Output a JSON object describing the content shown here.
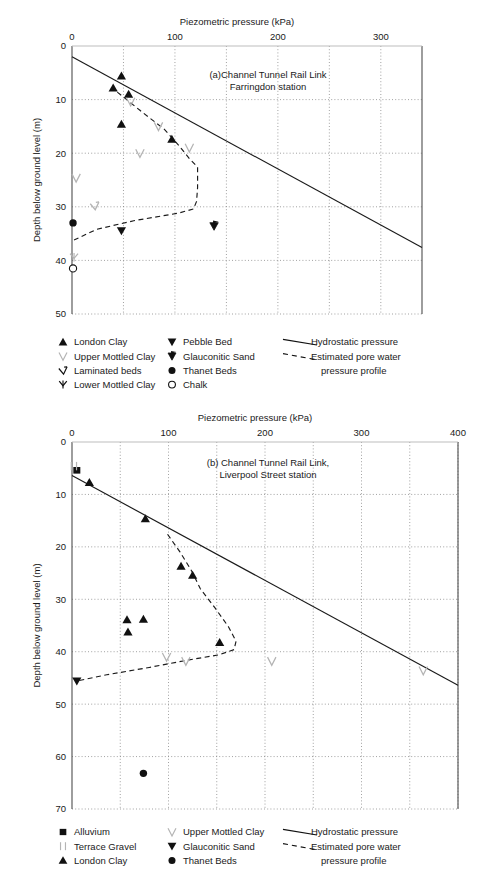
{
  "figure": {
    "panels": [
      "a",
      "b"
    ]
  },
  "chart_data": [
    {
      "id": "panel-a",
      "type": "scatter",
      "title": "(a)Channel Tunnel Rail Link",
      "title_line2": "Farringdon station",
      "xlabel": "Piezometric pressure (kPa)",
      "ylabel": "Depth below ground level (m)",
      "xlim": [
        0,
        340
      ],
      "ylim": [
        0,
        50
      ],
      "xticks": [
        0,
        100,
        200,
        300
      ],
      "xticklabels": [
        "0",
        "100",
        "200",
        "300"
      ],
      "xminor": [
        50,
        150,
        250
      ],
      "yticks": [
        0,
        10,
        20,
        30,
        40,
        50
      ],
      "yticklabels": [
        "0",
        "10",
        "20",
        "30",
        "40",
        "50"
      ],
      "grid": true,
      "legend_position": "below",
      "series": [
        {
          "name": "London Clay",
          "marker": "triangle-up",
          "color": "#111111",
          "points": [
            [
              48,
              5.6
            ],
            [
              40,
              7.8
            ],
            [
              55,
              9.0
            ],
            [
              48,
              14.6
            ],
            [
              97,
              17.4
            ]
          ]
        },
        {
          "name": "Upper Mottled Clay",
          "marker": "vee",
          "color": "#b4b4b4",
          "points": [
            [
              57,
              10.4
            ],
            [
              84,
              15.0
            ],
            [
              66,
              20.0
            ],
            [
              114,
              19.0
            ],
            [
              4,
              24.6
            ]
          ]
        },
        {
          "name": "Laminated beds",
          "marker": "vee-tilt",
          "color": "#b4b4b4",
          "points": [
            [
              22,
              29.8
            ]
          ]
        },
        {
          "name": "Lower Mottled Clay",
          "marker": "vee-stem",
          "color": "#b4b4b4",
          "points": [
            [
              2,
              39.4
            ]
          ]
        },
        {
          "name": "Pebble Bed",
          "marker": "triangle-down",
          "color": "#111111",
          "points": [
            [
              48,
              34.5
            ]
          ]
        },
        {
          "name": "Glauconitic Sand",
          "marker": "vee-flag",
          "color": "#111111",
          "points": [
            [
              138,
              33.6
            ]
          ]
        },
        {
          "name": "Thanet Beds",
          "marker": "circle",
          "color": "#111111",
          "points": [
            [
              1,
              33.0
            ]
          ]
        },
        {
          "name": "Chalk",
          "marker": "circle-open",
          "color": "#111111",
          "points": [
            [
              1,
              41.5
            ]
          ]
        }
      ],
      "lines": [
        {
          "name": "Hydrostatic pressure",
          "style": "solid",
          "points": [
            [
              0,
              2.0
            ],
            [
              340,
              37.6
            ]
          ]
        },
        {
          "name": "Estimated pore water pressure profile",
          "style": "dashed",
          "points": [
            [
              44,
              8.6
            ],
            [
              66,
              12.0
            ],
            [
              90,
              15.6
            ],
            [
              104,
              18.6
            ],
            [
              114,
              21.0
            ],
            [
              122,
              22.6
            ],
            [
              122,
              26.4
            ],
            [
              121,
              29.0
            ],
            [
              118,
              30.4
            ],
            [
              103,
              31.2
            ],
            [
              60,
              32.6
            ],
            [
              24,
              34.2
            ],
            [
              2,
              36.2
            ]
          ]
        }
      ],
      "legend": {
        "columns": [
          [
            {
              "label": "London Clay",
              "marker": "triangle-up",
              "color": "#111111"
            },
            {
              "label": "Upper Mottled Clay",
              "marker": "vee",
              "color": "#b4b4b4"
            },
            {
              "label": "Laminated beds",
              "marker": "vee-tilt",
              "color": "#111111"
            },
            {
              "label": "Lower Mottled Clay",
              "marker": "vee-stem",
              "color": "#111111"
            }
          ],
          [
            {
              "label": "Pebble Bed",
              "marker": "triangle-down",
              "color": "#111111"
            },
            {
              "label": "Glauconitic Sand",
              "marker": "vee-flag",
              "color": "#111111"
            },
            {
              "label": "Thanet Beds",
              "marker": "circle",
              "color": "#111111"
            },
            {
              "label": "Chalk",
              "marker": "circle-open",
              "color": "#111111"
            }
          ],
          [
            {
              "label": "Hydrostatic pressure",
              "marker": "line-solid",
              "color": "#111111"
            },
            {
              "label": "Estimated pore water",
              "marker": "line-dashed",
              "color": "#111111"
            },
            {
              "label": "pressure profile",
              "marker": "none",
              "color": "#111111"
            }
          ]
        ]
      }
    },
    {
      "id": "panel-b",
      "type": "scatter",
      "title": "(b) Channel Tunnel Rail Link,",
      "title_line2": "Liverpool Street station",
      "xlabel": "Piezometric pressure (kPa)",
      "ylabel": "Depth below ground level (m)",
      "xlim": [
        0,
        400
      ],
      "ylim": [
        0,
        70
      ],
      "xticks": [
        0,
        100,
        200,
        300,
        400
      ],
      "xticklabels": [
        "0",
        "100",
        "200",
        "300",
        "400"
      ],
      "xminor": [
        50,
        150,
        250,
        350
      ],
      "yticks": [
        0,
        10,
        20,
        30,
        40,
        50,
        60,
        70
      ],
      "yticklabels": [
        "0",
        "10",
        "20",
        "30",
        "40",
        "50",
        "60",
        "70"
      ],
      "grid": true,
      "legend_position": "below",
      "series": [
        {
          "name": "Alluvium",
          "marker": "square",
          "color": "#111111",
          "points": [
            [
              5,
              5.4
            ]
          ]
        },
        {
          "name": "Terrace Gravel",
          "marker": "bars",
          "color": "#b4b4b4",
          "points": [
            [
              2,
              4.6
            ]
          ]
        },
        {
          "name": "London Clay",
          "marker": "triangle-up",
          "color": "#111111",
          "points": [
            [
              18,
              7.7
            ],
            [
              76,
              14.6
            ],
            [
              113,
              23.7
            ],
            [
              125,
              25.4
            ],
            [
              57,
              33.9
            ],
            [
              74,
              33.8
            ],
            [
              58,
              36.2
            ],
            [
              153,
              38.2
            ]
          ]
        },
        {
          "name": "Upper Mottled Clay",
          "marker": "vee",
          "color": "#b4b4b4",
          "points": [
            [
              98,
              41.0
            ],
            [
              118,
              41.8
            ],
            [
              207,
              41.8
            ],
            [
              364,
              43.6
            ]
          ]
        },
        {
          "name": "Glauconitic Sand",
          "marker": "triangle-down",
          "color": "#111111",
          "points": [
            [
              5,
              45.6
            ]
          ]
        },
        {
          "name": "Thanet Beds",
          "marker": "circle",
          "color": "#111111",
          "points": [
            [
              74,
              63.2
            ]
          ]
        }
      ],
      "lines": [
        {
          "name": "Hydrostatic pressure",
          "style": "solid",
          "points": [
            [
              0,
              6.4
            ],
            [
              400,
              46.4
            ]
          ]
        },
        {
          "name": "Estimated pore water pressure profile",
          "style": "dashed",
          "points": [
            [
              99,
              17.6
            ],
            [
              112,
              21.0
            ],
            [
              124,
              24.6
            ],
            [
              133,
              28.0
            ],
            [
              148,
              31.6
            ],
            [
              162,
              35.2
            ],
            [
              170,
              38.0
            ],
            [
              168,
              39.6
            ],
            [
              152,
              40.6
            ],
            [
              120,
              41.6
            ],
            [
              80,
              43.0
            ],
            [
              36,
              44.4
            ],
            [
              5,
              45.6
            ]
          ]
        }
      ],
      "legend": {
        "columns": [
          [
            {
              "label": "Alluvium",
              "marker": "square",
              "color": "#111111"
            },
            {
              "label": "Terrace Gravel",
              "marker": "bars",
              "color": "#b4b4b4"
            },
            {
              "label": "London Clay",
              "marker": "triangle-up",
              "color": "#111111"
            }
          ],
          [
            {
              "label": "Upper Mottled Clay",
              "marker": "vee",
              "color": "#b4b4b4"
            },
            {
              "label": "Glauconitic Sand",
              "marker": "triangle-down",
              "color": "#111111"
            },
            {
              "label": "Thanet Beds",
              "marker": "circle",
              "color": "#111111"
            }
          ],
          [
            {
              "label": "Hydrostatic pressure",
              "marker": "line-solid",
              "color": "#111111"
            },
            {
              "label": "Estimated pore water",
              "marker": "line-dashed",
              "color": "#111111"
            },
            {
              "label": "pressure profile",
              "marker": "none",
              "color": "#111111"
            }
          ]
        ]
      }
    }
  ]
}
